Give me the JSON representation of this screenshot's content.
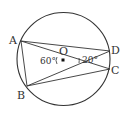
{
  "diagram": {
    "type": "circle-geometry",
    "circle": {
      "center_label": "O",
      "cx": 63.5,
      "cy": 59,
      "r": 46.5
    },
    "points": {
      "A": {
        "label": "A",
        "x": 21,
        "y": 41
      },
      "B": {
        "label": "B",
        "x": 27,
        "y": 86
      },
      "C": {
        "label": "C",
        "x": 110,
        "y": 69
      },
      "D": {
        "label": "D",
        "x": 110,
        "y": 51
      },
      "O": {
        "label": "O",
        "x": 63,
        "y": 60
      }
    },
    "segments": [
      "AB",
      "AD",
      "AC",
      "BD",
      "BC",
      "OD"
    ],
    "angles": {
      "AOB": {
        "label": "60°"
      },
      "DOC": {
        "label": "20°"
      }
    },
    "colors": {
      "stroke": "#333333",
      "background": "#ffffff"
    }
  }
}
